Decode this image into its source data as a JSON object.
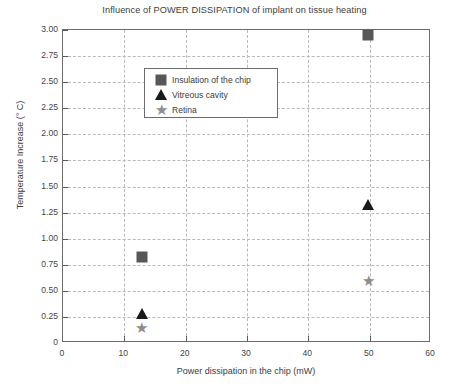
{
  "chart_data": {
    "type": "scatter",
    "title": "Influence of POWER DISSIPATION of implant on tissue heating",
    "xlabel": "Power dissipation in the chip (mW)",
    "ylabel": "Temperature Increase (° C)",
    "xlim": [
      0,
      60
    ],
    "ylim": [
      0,
      3.0
    ],
    "xticks": [
      "0",
      "10",
      "20",
      "30",
      "40",
      "50",
      "60"
    ],
    "xtick_values": [
      0,
      10,
      20,
      30,
      40,
      50,
      60
    ],
    "yticks": [
      "0",
      "0.25",
      "0.50",
      "0.75",
      "1.00",
      "1.25",
      "1.50",
      "1.75",
      "2.00",
      "2.25",
      "2.50",
      "2.75",
      "3.00"
    ],
    "ytick_values": [
      0,
      0.25,
      0.5,
      0.75,
      1.0,
      1.25,
      1.5,
      1.75,
      2.0,
      2.25,
      2.5,
      2.75,
      3.0
    ],
    "grid": true,
    "legend_position": "upper left",
    "series": [
      {
        "name": "Insulation of the chip",
        "marker": "square",
        "color": "#575757",
        "x": [
          12.8,
          49.8
        ],
        "y": [
          0.82,
          2.95
        ]
      },
      {
        "name": "Vitreous cavity",
        "marker": "triangle",
        "color": "#1a1a1a",
        "x": [
          12.8,
          49.8
        ],
        "y": [
          0.28,
          1.32
        ]
      },
      {
        "name": "Retina",
        "marker": "star",
        "color": "#8e8e8e",
        "x": [
          12.8,
          49.8
        ],
        "y": [
          0.14,
          0.59
        ]
      }
    ]
  },
  "legend": {
    "items": [
      {
        "label": "Insulation of the chip",
        "marker": "square"
      },
      {
        "label": "Vitreous cavity",
        "marker": "triangle"
      },
      {
        "label": "Retina",
        "marker": "star"
      }
    ]
  },
  "star_glyph": "★"
}
